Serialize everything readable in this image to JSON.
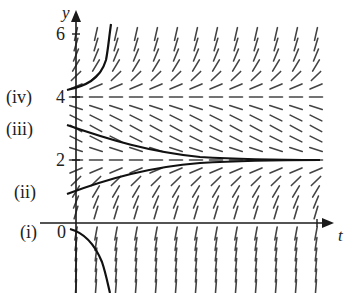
{
  "diagram": {
    "type": "slope_field",
    "equation_implied": "dy/dt = (y-2)(y-4)",
    "x_axis_label": "t",
    "y_axis_label": "y",
    "y_tick_labels": [
      {
        "value": 6,
        "label": "6"
      },
      {
        "value": 4,
        "label": "4"
      },
      {
        "value": 2,
        "label": "2"
      },
      {
        "value": 0,
        "label": "0"
      }
    ],
    "t_tick": {
      "value": 1,
      "label": ""
    },
    "equilibria": [
      2,
      4
    ],
    "solution_labels": [
      {
        "id": "i",
        "label": "(i)",
        "initial_y": 0
      },
      {
        "id": "ii",
        "label": "(ii)",
        "initial_y": 1
      },
      {
        "id": "iii",
        "label": "(iii)",
        "initial_y": 3
      },
      {
        "id": "iv",
        "label": "(iv)",
        "initial_y": 4.1
      }
    ],
    "colors": {
      "ink": "#1a1a1a",
      "slopes": "#444444",
      "background": "#ffffff"
    }
  }
}
